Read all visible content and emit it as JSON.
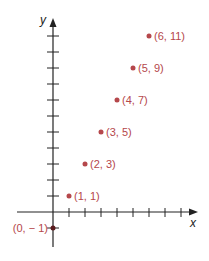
{
  "chart_data": {
    "type": "scatter",
    "title": "",
    "xlabel": "x",
    "ylabel": "y",
    "points": [
      {
        "x": 0,
        "y": -1,
        "label": "(0, − 1)"
      },
      {
        "x": 1,
        "y": 1,
        "label": "(1, 1)"
      },
      {
        "x": 2,
        "y": 3,
        "label": "(2, 3)"
      },
      {
        "x": 3,
        "y": 5,
        "label": "(3, 5)"
      },
      {
        "x": 4,
        "y": 7,
        "label": "(4, 7)"
      },
      {
        "x": 5,
        "y": 9,
        "label": "(5, 9)"
      },
      {
        "x": 6,
        "y": 11,
        "label": "(6, 11)"
      }
    ],
    "x": [
      0,
      1,
      2,
      3,
      4,
      5,
      6
    ],
    "y": [
      -1,
      1,
      3,
      5,
      7,
      9,
      11
    ],
    "xlim": [
      -3,
      9
    ],
    "ylim": [
      -2,
      12
    ],
    "x_ticks": [
      1,
      2,
      3,
      4,
      5,
      6,
      7,
      8
    ],
    "y_ticks": [
      -1,
      1,
      2,
      3,
      4,
      5,
      6,
      7,
      8,
      9,
      10,
      11
    ],
    "grid": false,
    "legend": null,
    "colors": {
      "points": "#b5474b",
      "axes": "#222222"
    }
  }
}
